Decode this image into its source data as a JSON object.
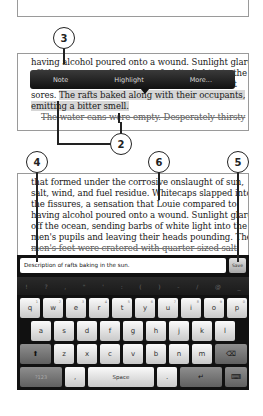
{
  "top_panel": {
    "lines": [
      "having alcohol poured onto a wound. Sunlight glared",
      "off the ocean, sending barbs of white light into the",
      "men's feet were cratered with quarter-sized salt",
      "sores. ",
      "The rafts baked along with their occupants,",
      "emitting a bitter smell.",
      "The water cans were empty. Desperately thirsty"
    ],
    "popup_menu": {
      "items": [
        "Note",
        "Highlight",
        "More..."
      ]
    }
  },
  "bottom_panel": {
    "lines": [
      "that formed under the corrosive onslaught of sun,",
      "salt, wind, and fuel residue. Whitecaps slapped into",
      "the fissures, a sensation that Louie compared to",
      "having alcohol poured onto a wound. Sunlight glared",
      "off the ocean, sending barbs of white light into the",
      "men's pupils and leaving their heads pounding. The",
      "men's feet were cratered with quarter-sized salt"
    ]
  },
  "note_bar": {
    "input_value": "Description of rafts baking in the sun.",
    "save_label": "Save"
  },
  "keyboard": {
    "symbols": [
      "!",
      "?",
      ",",
      "\"",
      "'",
      ":",
      "(",
      ")",
      "-",
      "/",
      "@",
      "_"
    ],
    "row1": [
      {
        "k": "q",
        "n": "1"
      },
      {
        "k": "w",
        "n": "2"
      },
      {
        "k": "e",
        "n": "3"
      },
      {
        "k": "r",
        "n": "4"
      },
      {
        "k": "t",
        "n": "5"
      },
      {
        "k": "y",
        "n": "6"
      },
      {
        "k": "u",
        "n": "7"
      },
      {
        "k": "i",
        "n": "8"
      },
      {
        "k": "o",
        "n": "9"
      },
      {
        "k": "p",
        "n": "0"
      }
    ],
    "row2": [
      "a",
      "s",
      "d",
      "f",
      "g",
      "h",
      "j",
      "k",
      "l"
    ],
    "row3": [
      "z",
      "x",
      "c",
      "v",
      "b",
      "n",
      "m"
    ],
    "shift": "⬆",
    "backspace": "⌫",
    "symbols_key": "?123",
    "comma": ",",
    "space": "Space",
    "period": ".",
    "enter": "↵",
    "hide_keyboard": "⌨"
  },
  "callouts": {
    "c2": "2",
    "c3": "3",
    "c4": "4",
    "c5": "5",
    "c6": "6"
  }
}
